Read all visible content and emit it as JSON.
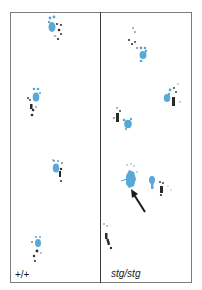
{
  "figure": {
    "panels": [
      {
        "genotype_label": "+/+",
        "footprints": [
          {
            "x": 52,
            "y": 22,
            "type": "forepaw-and-hindpaw"
          },
          {
            "x": 34,
            "y": 95,
            "type": "forepaw-and-hindpaw"
          },
          {
            "x": 52,
            "y": 168,
            "type": "forepaw-and-hindpaw"
          },
          {
            "x": 36,
            "y": 245,
            "type": "forepaw-and-hindpaw"
          }
        ]
      },
      {
        "genotype_label": "stg/stg",
        "footprints": [
          {
            "x": 140,
            "y": 48,
            "type": "forepaw-and-hindpaw"
          },
          {
            "x": 172,
            "y": 95,
            "type": "forepaw-and-hindpaw"
          },
          {
            "x": 123,
            "y": 122,
            "type": "forepaw-and-hindpaw"
          },
          {
            "x": 131,
            "y": 180,
            "type": "splayed-forepaw"
          },
          {
            "x": 157,
            "y": 185,
            "type": "forepaw-and-hindpaw"
          },
          {
            "x": 106,
            "y": 238,
            "type": "hindpaw"
          }
        ],
        "annotation": {
          "type": "arrow",
          "from": [
            145,
            212
          ],
          "to": [
            132,
            191
          ]
        }
      }
    ],
    "colors": {
      "forepaw": "#5aa8d8",
      "hindpaw": "#2a2a2a",
      "frame": "#7a7a7a",
      "divider": "#3a3a3a"
    }
  }
}
